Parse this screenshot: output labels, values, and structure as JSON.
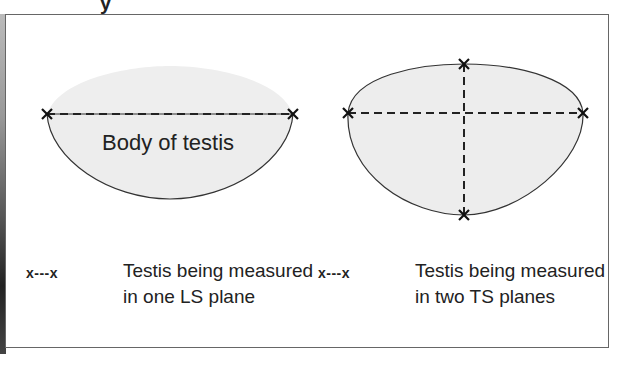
{
  "title_fragment": "y",
  "left_diagram": {
    "label": "Body of testis",
    "measurement": "one LS plane",
    "endpoints": [
      [
        47,
        114
      ],
      [
        293,
        114
      ]
    ]
  },
  "right_diagram": {
    "measurement": "two TS planes",
    "endpoints": [
      [
        348,
        113
      ],
      [
        583,
        113
      ],
      [
        464,
        64
      ],
      [
        464,
        215
      ]
    ]
  },
  "legend": [
    {
      "key": "x---x",
      "line1": "Testis being measured",
      "line2": "in one LS plane"
    },
    {
      "key": "x---x",
      "line1": "Testis being measured",
      "line2": "in two TS planes"
    }
  ],
  "colors": {
    "fill": "#ededed",
    "stroke": "#333333",
    "frame": "#666666"
  }
}
